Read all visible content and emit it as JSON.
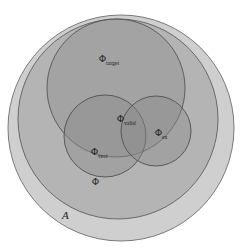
{
  "figure": {
    "type": "venn-diagram",
    "background_color": "#ffffff"
  },
  "sets": [
    {
      "id": "universe",
      "name": "universe-set",
      "symbol": "ℋ",
      "label_plain": "A",
      "subscript": "",
      "label_x": 62,
      "label_y": 219,
      "circle": {
        "cx": 121,
        "cy": 128,
        "r": 113
      },
      "fill": "#a8a8a8",
      "fill_opacity": 0.55,
      "stroke": "#6e6e6e",
      "stroke_width": 0.9
    },
    {
      "id": "phi",
      "name": "phi-set",
      "symbol": "Φ",
      "label_plain": "Φ",
      "subscript": "",
      "label_x": 92,
      "label_y": 185,
      "circle": {
        "cx": 118,
        "cy": 119,
        "r": 100
      },
      "fill": "#9a9a9a",
      "fill_opacity": 0.5,
      "stroke": "#5f5f5f",
      "stroke_width": 0.9
    },
    {
      "id": "phi_target",
      "name": "phi-target-set",
      "symbol": "Φ",
      "label_plain": "Φ",
      "subscript": "target",
      "label_x": 99,
      "label_y": 62,
      "circle": {
        "cx": 116,
        "cy": 88,
        "r": 69
      },
      "fill": "#8f8f8f",
      "fill_opacity": 0.45,
      "stroke": "#545454",
      "stroke_width": 0.9
    },
    {
      "id": "phi_vect",
      "name": "phi-vect-set",
      "symbol": "Φ",
      "label_plain": "Φ",
      "subscript": "vect",
      "label_x": 91,
      "label_y": 155,
      "circle": {
        "cx": 105,
        "cy": 136,
        "r": 41
      },
      "fill": "#8a8a8a",
      "fill_opacity": 0.42,
      "stroke": "#4f4f4f",
      "stroke_width": 0.9
    },
    {
      "id": "phi_ex",
      "name": "phi-ex-set",
      "symbol": "Φ",
      "label_plain": "Φ",
      "subscript": "ex",
      "label_x": 155,
      "label_y": 136,
      "circle": {
        "cx": 156,
        "cy": 131,
        "r": 35
      },
      "fill": "#8a8a8a",
      "fill_opacity": 0.42,
      "stroke": "#4f4f4f",
      "stroke_width": 0.9
    }
  ],
  "intersection_labels": [
    {
      "id": "phi_valid",
      "name": "phi-valid-label",
      "symbol": "Φ",
      "label_plain": "Φ",
      "subscript": "valid",
      "label_x": 117,
      "label_y": 122
    }
  ],
  "chart_data": {
    "type": "diagram",
    "subtype": "euler-venn",
    "title": "",
    "regions": [
      {
        "label": "A",
        "role": "universe",
        "contains": [
          "Φ"
        ]
      },
      {
        "label": "Φ",
        "role": "superset",
        "contains": [
          "Φ_target",
          "Φ_vect",
          "Φ_ex"
        ]
      },
      {
        "label": "Φ_target",
        "role": "set"
      },
      {
        "label": "Φ_vect",
        "role": "set"
      },
      {
        "label": "Φ_ex",
        "role": "set"
      },
      {
        "label": "Φ_valid",
        "role": "intersection",
        "of": [
          "Φ_target",
          "Φ_vect",
          "Φ_ex"
        ]
      }
    ]
  }
}
